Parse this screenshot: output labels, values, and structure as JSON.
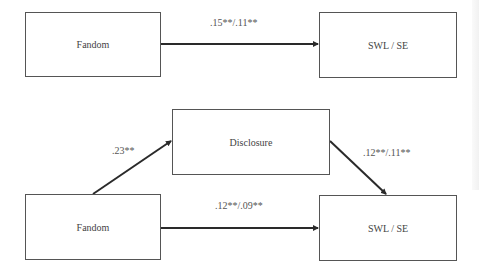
{
  "diagram": {
    "top_model": {
      "predictor": "Fandom",
      "outcome": "SWL / SE",
      "path_label": ".15**/.11**"
    },
    "bottom_model": {
      "predictor": "Fandom",
      "mediator": "Disclosure",
      "outcome": "SWL / SE",
      "path_a_label": ".23**",
      "path_b_label": ".12**/.11**",
      "path_c_prime_label": ".12**/.09**"
    }
  },
  "colors": {
    "line": "#2a2a2a",
    "border": "#555555",
    "text": "#444444"
  }
}
